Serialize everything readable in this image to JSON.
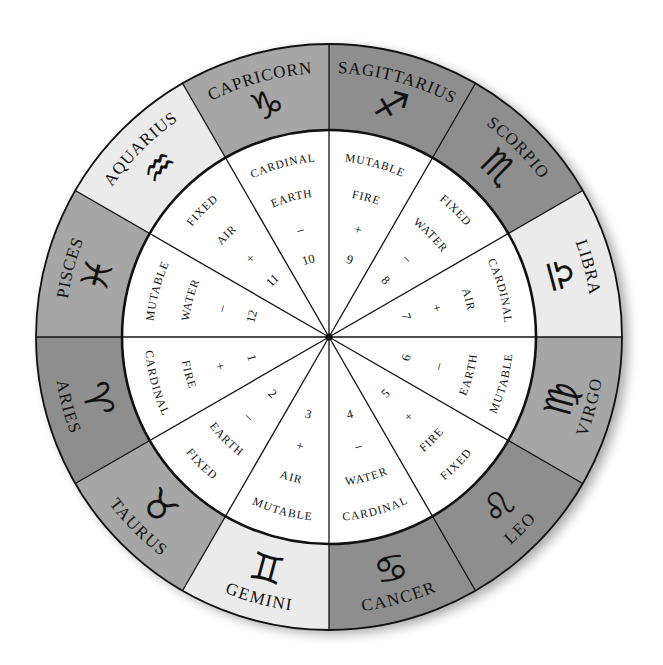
{
  "diagram": {
    "center": {
      "x": 329,
      "y": 337
    },
    "radii": {
      "outer": 293,
      "inner": 207,
      "sign_name": 270,
      "glyph": 240,
      "quality": 180,
      "element": 145,
      "polarity": 112,
      "house_number": 80
    },
    "colors": {
      "light": "#ebebeb",
      "medium": "#a6a6a6",
      "dark": "#8e8e8e",
      "line": "#111111",
      "inner_fill": "#ffffff"
    },
    "outer_ring": [
      {
        "name": "LIBRA",
        "glyph": "♎",
        "glyph_icon": "libra-icon",
        "start_deg": 0,
        "shade": "light"
      },
      {
        "name": "SCORPIO",
        "glyph": "♏",
        "glyph_icon": "scorpio-icon",
        "start_deg": 30,
        "shade": "dark"
      },
      {
        "name": "SAGITTARIUS",
        "glyph": "♐",
        "glyph_icon": "sagittarius-icon",
        "start_deg": 60,
        "shade": "dark"
      },
      {
        "name": "CAPRICORN",
        "glyph": "♑",
        "glyph_icon": "capricorn-icon",
        "start_deg": 90,
        "shade": "medium"
      },
      {
        "name": "AQUARIUS",
        "glyph": "♒",
        "glyph_icon": "aquarius-icon",
        "start_deg": 120,
        "shade": "light"
      },
      {
        "name": "PISCES",
        "glyph": "♓",
        "glyph_icon": "pisces-icon",
        "start_deg": 150,
        "shade": "medium"
      },
      {
        "name": "ARIES",
        "glyph": "♈",
        "glyph_icon": "aries-icon",
        "start_deg": 180,
        "shade": "dark"
      },
      {
        "name": "TAURUS",
        "glyph": "♉",
        "glyph_icon": "taurus-icon",
        "start_deg": 210,
        "shade": "medium"
      },
      {
        "name": "GEMINI",
        "glyph": "♊",
        "glyph_icon": "gemini-icon",
        "start_deg": 240,
        "shade": "light"
      },
      {
        "name": "CANCER",
        "glyph": "♋",
        "glyph_icon": "cancer-icon",
        "start_deg": 270,
        "shade": "dark"
      },
      {
        "name": "LEO",
        "glyph": "♌",
        "glyph_icon": "leo-icon",
        "start_deg": 300,
        "shade": "dark"
      },
      {
        "name": "VIRGO",
        "glyph": "♍",
        "glyph_icon": "virgo-icon",
        "start_deg": 330,
        "shade": "medium"
      }
    ],
    "inner_ring": [
      {
        "house": "7",
        "quality": "CARDINAL",
        "element": "AIR",
        "polarity": "+",
        "start_deg": 0
      },
      {
        "house": "8",
        "quality": "FIXED",
        "element": "WATER",
        "polarity": "–",
        "start_deg": 30
      },
      {
        "house": "9",
        "quality": "MUTABLE",
        "element": "FIRE",
        "polarity": "+",
        "start_deg": 60
      },
      {
        "house": "10",
        "quality": "CARDINAL",
        "element": "EARTH",
        "polarity": "–",
        "start_deg": 90
      },
      {
        "house": "11",
        "quality": "FIXED",
        "element": "AIR",
        "polarity": "+",
        "start_deg": 120
      },
      {
        "house": "12",
        "quality": "MUTABLE",
        "element": "WATER",
        "polarity": "–",
        "start_deg": 150
      },
      {
        "house": "1",
        "quality": "CARDINAL",
        "element": "FIRE",
        "polarity": "+",
        "start_deg": 180
      },
      {
        "house": "2",
        "quality": "FIXED",
        "element": "EARTH",
        "polarity": "–",
        "start_deg": 210
      },
      {
        "house": "3",
        "quality": "MUTABLE",
        "element": "AIR",
        "polarity": "+",
        "start_deg": 240
      },
      {
        "house": "4",
        "quality": "CARDINAL",
        "element": "WATER",
        "polarity": "–",
        "start_deg": 270
      },
      {
        "house": "5",
        "quality": "FIXED",
        "element": "FIRE",
        "polarity": "+",
        "start_deg": 300
      },
      {
        "house": "6",
        "quality": "MUTABLE",
        "element": "EARTH",
        "polarity": "–",
        "start_deg": 330
      }
    ]
  }
}
